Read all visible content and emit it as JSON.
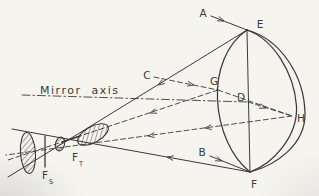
{
  "colors": {
    "paper": "#f6f4ef",
    "ink": "#3a3a38"
  },
  "labels": {
    "incident_ray_a": "A",
    "incident_ray_b": "B",
    "incident_ray_c": "C",
    "incident_ray_d": "D",
    "rim_point_top": "E",
    "rim_point_bottom": "F",
    "rim_point_near": "G",
    "rim_point_far": "H",
    "mirror_axis": "Mirror axis",
    "tangential_focus": {
      "main": "F",
      "sub": "T"
    },
    "sagittal_focus": {
      "main": "F",
      "sub": "S"
    }
  }
}
